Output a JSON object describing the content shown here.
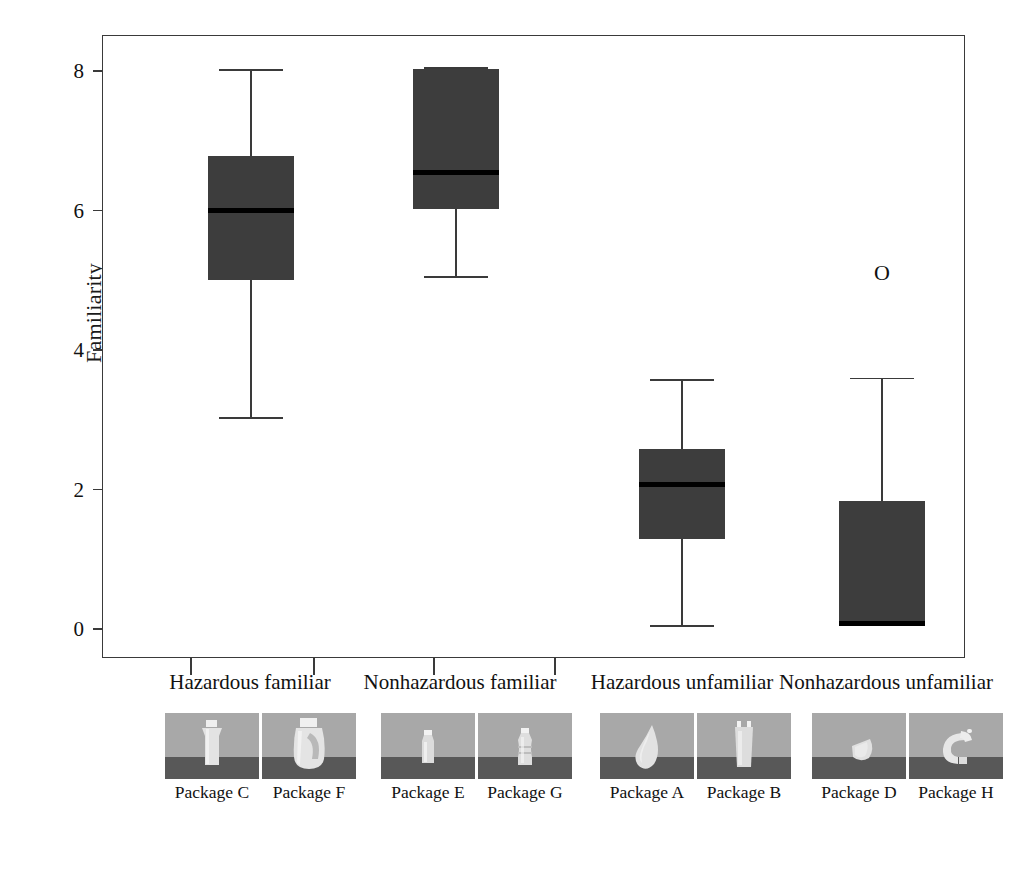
{
  "chart_data": {
    "type": "box",
    "title": "",
    "xlabel": "",
    "ylabel": "Familiarity",
    "ylim": [
      -0.35,
      8.6
    ],
    "yticks": [
      0,
      2,
      4,
      6,
      8
    ],
    "ytick_labels": [
      "0",
      "2",
      "4",
      "6",
      "8"
    ],
    "grid": false,
    "legend": "none",
    "categories": [
      "Hazardous familiar",
      "Nonhazardous familiar",
      "Hazardous unfamiliar",
      "Nonhazardous unfamiliar"
    ],
    "boxes": [
      {
        "category": "Hazardous familiar",
        "whisker_low": 3.05,
        "q1": 5.02,
        "median": 6.02,
        "q3": 6.8,
        "whisker_high": 8.04,
        "outliers": []
      },
      {
        "category": "Nonhazardous familiar",
        "whisker_low": 5.07,
        "q1": 6.04,
        "median": 6.56,
        "q3": 8.05,
        "whisker_high": 8.07,
        "outliers": []
      },
      {
        "category": "Hazardous unfamiliar",
        "whisker_low": 0.07,
        "q1": 1.31,
        "median": 2.08,
        "q3": 2.6,
        "whisker_high": 3.6,
        "outliers": []
      },
      {
        "category": "Nonhazardous unfamiliar",
        "whisker_low": 0.1,
        "q1": 0.1,
        "median": 0.1,
        "q3": 1.85,
        "whisker_high": 3.62,
        "outliers": [
          5.1
        ]
      }
    ],
    "colors": {
      "box_fill": "#3d3d3d",
      "median_line": "#000000",
      "whisker": "#3a3a3a",
      "axis": "#3a3a3a",
      "background": "#ffffff"
    }
  },
  "axes": {
    "y_title": "Familiarity",
    "y_tick_labels": [
      "8",
      "6",
      "4",
      "2",
      "0"
    ]
  },
  "category_labels": [
    "Hazardous familiar",
    "Nonhazardous familiar",
    "Hazardous unfamiliar",
    "Nonhazardous unfamiliar"
  ],
  "package_groups": [
    {
      "group": "Hazardous familiar",
      "packages": [
        {
          "label": "Package C",
          "shape": "tall-tapered-bottle"
        },
        {
          "label": "Package F",
          "shape": "handled-jug"
        }
      ]
    },
    {
      "group": "Nonhazardous familiar",
      "packages": [
        {
          "label": "Package E",
          "shape": "slim-water-bottle"
        },
        {
          "label": "Package G",
          "shape": "ribbed-water-bottle"
        }
      ]
    },
    {
      "group": "Hazardous unfamiliar",
      "packages": [
        {
          "label": "Package A",
          "shape": "teardrop-blob"
        },
        {
          "label": "Package B",
          "shape": "forked-tube"
        }
      ]
    },
    {
      "group": "Nonhazardous unfamiliar",
      "packages": [
        {
          "label": "Package D",
          "shape": "wedge-pod"
        },
        {
          "label": "Package H",
          "shape": "ring-handle"
        }
      ]
    }
  ],
  "outlier_glyph": "O"
}
